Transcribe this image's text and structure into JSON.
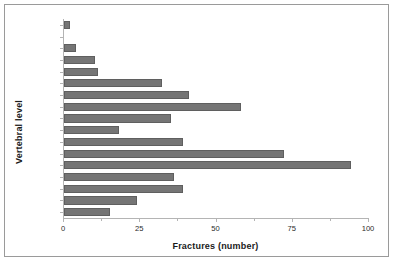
{
  "chart_data": {
    "type": "bar",
    "orientation": "horizontal",
    "title": "",
    "xlabel": "Fractures (number)",
    "ylabel": "Vertebral level",
    "categories": [
      "T1",
      "T2",
      "T3",
      "T4",
      "T5",
      "T6",
      "T7",
      "T8",
      "T9",
      "T10",
      "T11",
      "T12",
      "L1",
      "L2",
      "L3",
      "L4",
      "L5"
    ],
    "values": [
      2,
      0,
      4,
      10,
      11,
      32,
      41,
      58,
      35,
      18,
      39,
      72,
      94,
      36,
      39,
      24,
      15
    ],
    "xlim": [
      0,
      100
    ],
    "xticks": [
      0,
      25,
      50,
      75,
      100
    ],
    "xtick_labels": [
      "0",
      "25",
      "50",
      "75",
      "100"
    ],
    "xminor_ticks": [
      12.5,
      37.5,
      62.5,
      87.5
    ],
    "grid": false,
    "legend": false,
    "bar_color": "#757575",
    "axis_color": "#b4b4b4",
    "frame_color": "#9a9a9a",
    "background": "#ffffff"
  }
}
